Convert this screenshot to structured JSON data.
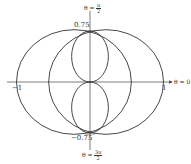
{
  "chart_data": {
    "type": "polar",
    "title": "",
    "curves": [
      {
        "name": "outer-curve",
        "description": "two overlapping circle arcs",
        "circles": [
          {
            "cx": 0.21875,
            "cy": 0,
            "r": 0.78125
          },
          {
            "cx": -0.21875,
            "cy": 0,
            "r": 0.78125
          }
        ]
      },
      {
        "name": "inner-figure-eight",
        "loops": [
          {
            "cx": 0,
            "cy": 0.375,
            "rx": 0.25,
            "ry": 0.375
          },
          {
            "cx": 0,
            "cy": -0.375,
            "rx": 0.25,
            "ry": 0.375
          }
        ]
      }
    ],
    "axis_labels": {
      "right": "θ = 0",
      "top_prefix": "θ = ",
      "top_num": "π",
      "top_den": "2",
      "bottom_prefix": "θ = ",
      "bottom_num": "3π",
      "bottom_den": "2"
    },
    "tick_labels": {
      "x_neg": "−1",
      "x_pos": "1",
      "y_pos": "0.75",
      "y_neg": "−0.75"
    },
    "xlim": [
      -1,
      1
    ],
    "ylim": [
      -0.75,
      0.75
    ],
    "colors": {
      "curve": "#333333",
      "axis": "#444444"
    }
  }
}
